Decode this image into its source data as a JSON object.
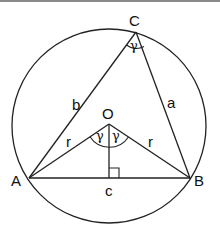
{
  "diagram": {
    "vertices": {
      "A": "A",
      "B": "B",
      "C": "C",
      "O": "O"
    },
    "sides": {
      "a": "a",
      "b": "b",
      "c": "c"
    },
    "radius_label_left": "r",
    "radius_label_right": "r",
    "angle_at_C": "γ",
    "angle_at_O_left": "γ",
    "angle_at_O_right": "γ"
  }
}
